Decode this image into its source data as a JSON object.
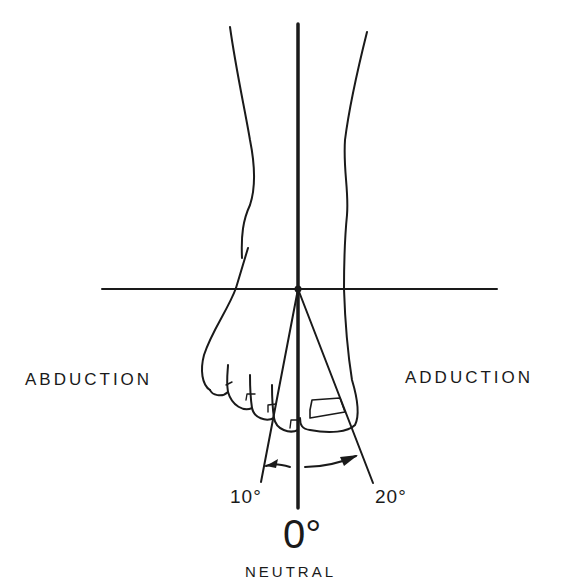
{
  "diagram": {
    "labels": {
      "left_motion": "ABDUCTION",
      "right_motion": "ADDUCTION",
      "left_angle": "10°",
      "right_angle": "20°",
      "neutral_angle": "0°",
      "neutral_label": "NEUTRAL"
    },
    "colors": {
      "ink": "#1a1a1a",
      "background": "#ffffff"
    },
    "angles": {
      "abduction_deg": 10,
      "adduction_deg": 20,
      "neutral_deg": 0
    }
  }
}
